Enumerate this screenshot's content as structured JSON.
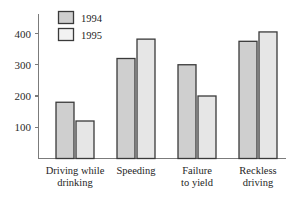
{
  "chart_data": {
    "type": "bar",
    "title": "",
    "subtitle": "",
    "xlabel": "",
    "ylabel": "",
    "categories": [
      "Driving while drinking",
      "Speeding",
      "Failure to yield",
      "Reckless driving"
    ],
    "category_lines": [
      [
        "Driving while",
        "drinking"
      ],
      [
        "Speeding",
        ""
      ],
      [
        "Failure",
        "to yield"
      ],
      [
        "Reckless",
        "driving"
      ]
    ],
    "series": [
      {
        "name": "1994",
        "values": [
          180,
          320,
          300,
          375
        ],
        "color": "#cfcfcf"
      },
      {
        "name": "1995",
        "values": [
          120,
          382,
          200,
          405
        ],
        "color": "#e6e6e6"
      }
    ],
    "ylim": [
      0,
      440
    ],
    "yticks": [
      100,
      200,
      300,
      400
    ],
    "ytick_labels": [
      "100",
      "200",
      "300",
      "400"
    ],
    "grid": false,
    "legend_position": "top-left-inside",
    "legend_entries": [
      "1994",
      "1995"
    ]
  },
  "axis": {
    "y_axis_name": "vertical-value-axis",
    "x_axis_name": "horizontal-category-axis"
  },
  "legend": {
    "items": [
      {
        "label": "1994",
        "swatch": "legend-swatch-1994"
      },
      {
        "label": "1995",
        "swatch": "legend-swatch-1995"
      }
    ]
  }
}
